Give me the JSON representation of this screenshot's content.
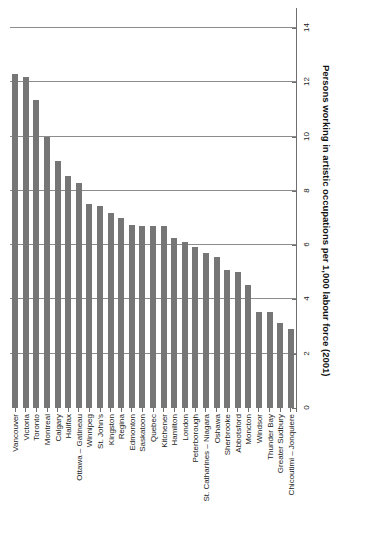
{
  "chart_data": {
    "type": "bar",
    "title": "",
    "subtitle": "",
    "xlabel": "",
    "ylabel": "Persons working in artistic occupations per 1,000  labour force (2001)",
    "ylim": [
      0,
      14
    ],
    "yticks": [
      0,
      2,
      4,
      6,
      8,
      10,
      12,
      14
    ],
    "ytick_labels": [
      "0",
      "2",
      "4",
      "6",
      "8",
      "10",
      "12",
      "14"
    ],
    "grid": true,
    "legend": "none",
    "orientation": "vertical",
    "bar_color": "#767676",
    "gridline_color": "#8c8c8c",
    "axis_color": "#6e6e6e",
    "background": "#ffffff",
    "categories": [
      "Vancouver",
      "Victoria",
      "Toronto",
      "Montreal",
      "Calgary",
      "Halifax",
      "Ottawa – Gatineau",
      "Winnipeg",
      "St. John's",
      "Kingston",
      "Regina",
      "Edmonton",
      "Saskatoon",
      "Quebec",
      "Kitchener",
      "Hamilton",
      "London",
      "Peterborough",
      "St. Catharines – Niagara",
      "Oshawa",
      "Sherbrooke",
      "Abbotsford",
      "Moncton",
      "Windsor",
      "Thunder Bay",
      "Greater Sudbury",
      "Chicoutimi – Jonquiere"
    ],
    "values": [
      12.3,
      12.2,
      11.35,
      10.0,
      9.1,
      8.55,
      8.3,
      7.5,
      7.45,
      7.2,
      7.0,
      6.75,
      6.7,
      6.7,
      6.7,
      6.25,
      6.1,
      5.95,
      5.7,
      5.55,
      5.1,
      5.0,
      4.55,
      3.55,
      3.55,
      3.15,
      2.9
    ]
  }
}
